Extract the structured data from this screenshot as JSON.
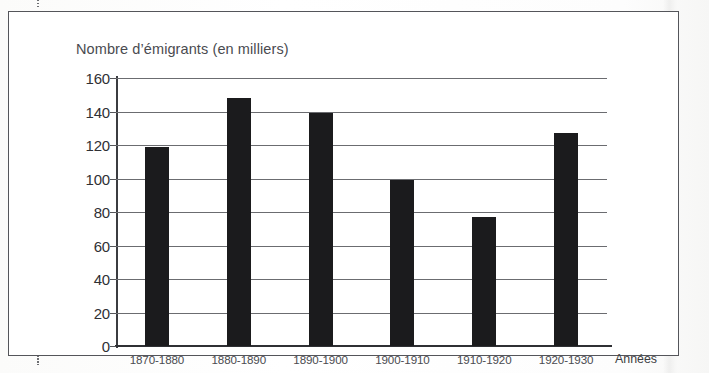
{
  "chart_data": {
    "type": "bar",
    "title": "Nombre d’émigrants (en milliers)",
    "xlabel": "Années",
    "ylabel": "",
    "categories": [
      "1870-1880",
      "1880-1890",
      "1890-1900",
      "1900-1910",
      "1910-1920",
      "1920-1930"
    ],
    "values": [
      119,
      148,
      139,
      99,
      77,
      127
    ],
    "ylim": [
      0,
      160
    ],
    "ytick_labels": [
      "0",
      "20",
      "40",
      "60",
      "80",
      "100",
      "120",
      "140",
      "160"
    ],
    "ytick_values": [
      0,
      20,
      40,
      60,
      80,
      100,
      120,
      140,
      160
    ],
    "grid": true,
    "legend": "none",
    "bar_color": "#1b1b1d",
    "axis_color": "#2f3034",
    "grid_color": "#6b6c70",
    "text_color": "#4a4b50"
  }
}
